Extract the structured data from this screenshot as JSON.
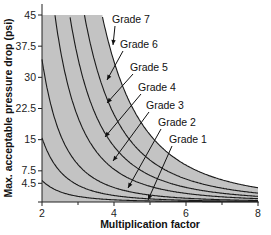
{
  "chart_data": {
    "type": "line",
    "title": "",
    "xlabel": "Multiplication factor",
    "ylabel": "Max. acceptable pressure drop (psi)",
    "xlim": [
      2,
      8
    ],
    "ylim": [
      0,
      45
    ],
    "x_ticks": [
      2,
      4,
      6,
      8
    ],
    "x_minor_ticks": [
      3,
      5,
      7
    ],
    "y_ticks": [
      4.5,
      7.5,
      15,
      22.5,
      30,
      37.5,
      45
    ],
    "y_tick_labels": [
      "4.5",
      "7.5",
      "15",
      "22.5",
      "30",
      "37.5",
      "45"
    ],
    "grid": false,
    "legend": "inline-labels-with-arrows",
    "shaded_region": {
      "color": "#c3c3c3",
      "description": "area under Grade 7 curve, capped at 45 psi"
    },
    "exponent": 3.3,
    "series": [
      {
        "name": "Grade 1",
        "k": 51,
        "points": [
          [
            2,
            5.2
          ],
          [
            4,
            0.53
          ],
          [
            6,
            0.15
          ],
          [
            8,
            0.05
          ]
        ]
      },
      {
        "name": "Grade 2",
        "k": 152,
        "points": [
          [
            2,
            15.5
          ],
          [
            4,
            1.6
          ],
          [
            6,
            0.4
          ],
          [
            8,
            0.16
          ]
        ]
      },
      {
        "name": "Grade 3",
        "k": 338,
        "points": [
          [
            2,
            34.4
          ],
          [
            4,
            3.5
          ],
          [
            6,
            0.9
          ],
          [
            8,
            0.35
          ]
        ]
      },
      {
        "name": "Grade 4",
        "k": 764,
        "points": [
          [
            2.36,
            45
          ],
          [
            4,
            8.0
          ],
          [
            6,
            2.1
          ],
          [
            8,
            0.8
          ]
        ]
      },
      {
        "name": "Grade 5",
        "k": 1298,
        "points": [
          [
            2.78,
            45
          ],
          [
            4,
            13.6
          ],
          [
            6,
            3.5
          ],
          [
            8,
            1.3
          ]
        ]
      },
      {
        "name": "Grade 6",
        "k": 2045,
        "points": [
          [
            3.17,
            45
          ],
          [
            4,
            21.4
          ],
          [
            6,
            5.6
          ],
          [
            8,
            2.1
          ]
        ]
      },
      {
        "name": "Grade 7",
        "k": 3280,
        "points": [
          [
            3.67,
            45
          ],
          [
            4,
            34.3
          ],
          [
            6,
            8.9
          ],
          [
            8,
            3.4
          ]
        ]
      }
    ],
    "annotations": [
      {
        "text": "Grade 7",
        "label_xy_px": [
          112,
          23
        ],
        "arrow_to_px": [
          113,
          45
        ]
      },
      {
        "text": "Grade 6",
        "label_xy_px": [
          120,
          48
        ],
        "arrow_to_px": [
          107,
          80
        ]
      },
      {
        "text": "Grade 5",
        "label_xy_px": [
          130,
          71
        ],
        "arrow_to_px": [
          107,
          103
        ]
      },
      {
        "text": "Grade 4",
        "label_xy_px": [
          138,
          91
        ],
        "arrow_to_px": [
          105,
          137
        ]
      },
      {
        "text": "Grade 3",
        "label_xy_px": [
          146,
          109
        ],
        "arrow_to_px": [
          113,
          161
        ]
      },
      {
        "text": "Grade 2",
        "label_xy_px": [
          158,
          126
        ],
        "arrow_to_px": [
          128,
          188
        ]
      },
      {
        "text": "Grade 1",
        "label_xy_px": [
          169,
          143
        ],
        "arrow_to_px": [
          148,
          200
        ]
      }
    ]
  },
  "labels": {
    "xlabel": "Multiplication factor",
    "ylabel": "Max. acceptable pressure drop (psi)",
    "x_ticks": [
      "2",
      "4",
      "6",
      "8"
    ],
    "y_ticks": [
      "45",
      "37.5",
      "30",
      "22.5",
      "15",
      "7.5",
      "4.5"
    ],
    "grades": [
      "Grade 7",
      "Grade 6",
      "Grade 5",
      "Grade 4",
      "Grade 3",
      "Grade 2",
      "Grade 1"
    ]
  }
}
